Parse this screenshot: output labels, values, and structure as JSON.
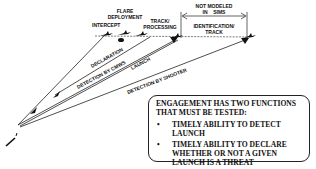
{
  "diagram": {
    "labels": {
      "intercept": "INTERCEPT",
      "flare_deployment_1": "FLARE",
      "flare_deployment_2": "DEPLOYMENT",
      "track_processing_1": "TRACK/",
      "track_processing_2": "PROCESSING",
      "not_modeled_1": "NOT MODELED",
      "not_modeled_2": "IN    SIMS",
      "identification_1": "IDENTIFICATION/",
      "identification_2": "TRACK",
      "declaration": "DECLARATION",
      "detection_by_cmws": "DETECTION BY CMWS",
      "launch": "LAUNCH",
      "detection_by_shooter": "DETECTION BY SHOOTER"
    },
    "icons": {
      "aircraft": "aircraft-icon",
      "missile": "missile-icon",
      "arrowhead": "arrowhead-icon"
    }
  },
  "callout": {
    "title": "ENGAGEMENT HAS TWO FUNCTIONS THAT MUST BE TESTED:",
    "bullet_symbol": "•",
    "items": [
      "TIMELY ABILITY TO DETECT LAUNCH",
      "TIMELY ABILITY TO DECLARE WHETHER OR NOT A GIVEN LAUNCH IS A THREAT"
    ]
  }
}
